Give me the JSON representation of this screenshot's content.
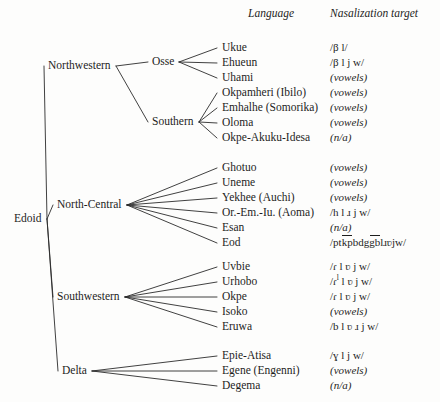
{
  "figure": {
    "width": 440,
    "height": 402,
    "line_color": "#2b2b2b",
    "text_color": "#1d1d1d",
    "background": "#fdfdfc"
  },
  "columns": {
    "language_header": "Language",
    "target_header": "Nasalization target"
  },
  "root": {
    "label": "Edoid",
    "x": 14,
    "y": 219
  },
  "branches": [
    {
      "label": "Northwestern",
      "x": 48,
      "y": 66,
      "subgroups": [
        {
          "label": "Osse",
          "x": 152,
          "y": 62,
          "leaves": [
            {
              "language": "Ukue",
              "target": "/β l/",
              "italic": false,
              "y": 48
            },
            {
              "language": "Ehueun",
              "target": "/β l j w/",
              "italic": false,
              "y": 63
            },
            {
              "language": "Uhami",
              "target": "(vowels)",
              "italic": true,
              "y": 78
            }
          ]
        },
        {
          "label": "Southern",
          "x": 152,
          "y": 122,
          "leaves": [
            {
              "language": "Okpamheri (Ibilo)",
              "target": "(vowels)",
              "italic": true,
              "y": 93
            },
            {
              "language": "Emhalhe (Somorika)",
              "target": "(vowels)",
              "italic": true,
              "y": 108
            },
            {
              "language": "Oloma",
              "target": "(vowels)",
              "italic": true,
              "y": 123
            },
            {
              "language": "Okpe-Akuku-Idesa",
              "target": "(n/a)",
              "italic": true,
              "y": 138
            }
          ]
        }
      ]
    },
    {
      "label": "North-Central",
      "x": 57,
      "y": 205,
      "subgroups": [
        {
          "label": "",
          "x": 143,
          "y": 205,
          "leaves": [
            {
              "language": "Ghotuo",
              "target": "(vowels)",
              "italic": true,
              "y": 168
            },
            {
              "language": "Uneme",
              "target": "(vowels)",
              "italic": true,
              "y": 183
            },
            {
              "language": "Yekhee (Auchi)",
              "target": "(vowels)",
              "italic": true,
              "y": 198
            },
            {
              "language": "Or.-Em.-Iu. (Aoma)",
              "target": "/h l ɹ j w/",
              "italic": false,
              "y": 213
            },
            {
              "language": "Esan",
              "target": "(n/a)",
              "italic": true,
              "y": 228
            },
            {
              "language": "Eod",
              "target": "EOD_SPECIAL",
              "italic": false,
              "y": 243
            }
          ]
        }
      ]
    },
    {
      "label": "Southwestern",
      "x": 57,
      "y": 297,
      "subgroups": [
        {
          "label": "",
          "x": 137,
          "y": 297,
          "leaves": [
            {
              "language": "Uvbie",
              "target": "/ɾ l ʋ j w/",
              "italic": false,
              "y": 267
            },
            {
              "language": "Urhobo",
              "target": "URHOBO_SPECIAL",
              "italic": false,
              "y": 282
            },
            {
              "language": "Okpe",
              "target": "/ɾ l ʋ j w/",
              "italic": false,
              "y": 297
            },
            {
              "language": "Isoko",
              "target": "(vowels)",
              "italic": true,
              "y": 312
            },
            {
              "language": "Eruwa",
              "target": "/b l ʋ ɹ j w/",
              "italic": false,
              "y": 327
            }
          ]
        }
      ]
    },
    {
      "label": "Delta",
      "x": 62,
      "y": 371,
      "subgroups": [
        {
          "label": "",
          "x": 110,
          "y": 371,
          "leaves": [
            {
              "language": "Epie-Atisa",
              "target": "/ɣ l j w/",
              "italic": false,
              "y": 356
            },
            {
              "language": "Egene (Engenni)",
              "target": "(vowels)",
              "italic": true,
              "y": 371
            },
            {
              "language": "Degema",
              "target": "(n/a)",
              "italic": true,
              "y": 386
            }
          ]
        }
      ]
    }
  ],
  "special_targets": {
    "eod": {
      "open": "/",
      "p": "p",
      "t": "t",
      "kp": "kp",
      "b": "b",
      "d": "d",
      "g": "g",
      "gb": "gb",
      "l": "l",
      "r": "ɹ",
      "v": "ʋ",
      "j": "j",
      "w": "w",
      "close": "/"
    },
    "urhobo": {
      "open": "/",
      "r": "ɾ",
      "sup": "l",
      "rest": " l ʋ j w",
      "close": "/"
    }
  },
  "layout": {
    "language_col_x": 222,
    "target_col_x": 330,
    "header_language_x": 248,
    "header_target_x": 330,
    "header_y": 14
  }
}
